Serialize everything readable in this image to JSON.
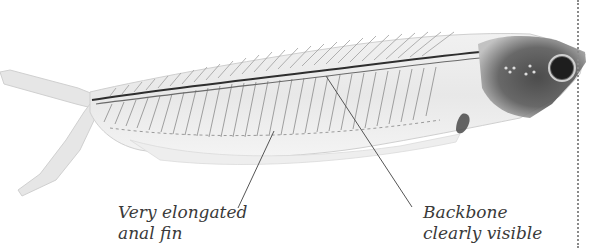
{
  "image": {
    "subject": "transparent glass catfish showing skeleton",
    "annotations": [
      {
        "id": "anal-fin",
        "lines": [
          "Very elongated",
          "anal fin"
        ]
      },
      {
        "id": "backbone",
        "lines": [
          "Backbone",
          "clearly visible"
        ]
      }
    ]
  },
  "colors": {
    "background": "#ffffff",
    "label_text": "#3a3a3a",
    "leader_line": "#555555",
    "border_dots": "#8a8a8a"
  }
}
